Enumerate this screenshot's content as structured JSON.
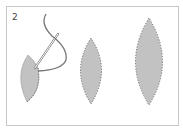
{
  "figure": {
    "step_label": "2",
    "colors": {
      "fill": "#c2c2c2",
      "stitch": "#6a6a6a",
      "thread": "#7a7a7a",
      "border": "#c8c8c8"
    },
    "shapes": [
      {
        "name": "partial-leaf-being-sewn",
        "state": "in-progress"
      },
      {
        "name": "small-leaf",
        "state": "stitched"
      },
      {
        "name": "large-leaf",
        "state": "stitched"
      }
    ]
  }
}
